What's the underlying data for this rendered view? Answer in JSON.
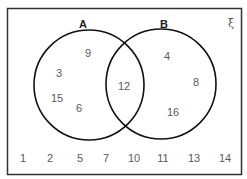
{
  "diagram": {
    "type": "venn",
    "universal_symbol": "ξ",
    "sets": [
      {
        "name": "A",
        "label": "A",
        "only": [
          "9",
          "3",
          "15",
          "6"
        ]
      },
      {
        "name": "B",
        "label": "B",
        "only": [
          "4",
          "8",
          "16"
        ]
      }
    ],
    "intersection": [
      "12"
    ],
    "outside": [
      "1",
      "2",
      "5",
      "7",
      "10",
      "11",
      "13",
      "14"
    ]
  }
}
